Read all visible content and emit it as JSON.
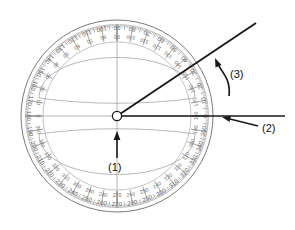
{
  "figure": {
    "kind": "protractor-diagram",
    "background_color": "#ffffff",
    "line_color": "#1a1a1a",
    "scale_color": "#6b6b6b",
    "faint_color": "#9a9a9a"
  },
  "protractor": {
    "name": "circular-protractor",
    "center_x": 117,
    "center_y": 116,
    "outer_radius": 96,
    "ring_inner_radius": 74,
    "tick_major_every_deg": 10,
    "tick_minor_every_deg": 1,
    "scale_outer_labels": [
      0,
      10,
      20,
      30,
      40,
      50,
      60,
      70,
      80,
      90,
      100,
      110,
      120,
      130,
      140,
      150,
      160,
      170,
      180,
      190,
      200,
      210,
      220,
      230,
      240,
      250,
      260,
      270,
      280,
      290,
      300,
      310,
      320,
      330,
      340,
      350
    ],
    "scale_inner_labels": [
      180,
      170,
      160,
      150,
      140,
      130,
      120,
      110,
      100,
      90,
      80,
      70,
      60,
      50,
      40,
      30,
      20,
      10,
      0,
      350,
      340,
      330,
      320,
      310,
      300,
      290,
      280,
      270,
      260,
      250,
      240,
      230,
      220,
      210,
      200,
      190
    ],
    "cardinal_top": "90",
    "cardinal_bottom": "270",
    "cardinal_left": "180",
    "cardinal_right": "0"
  },
  "arm": {
    "name": "rotating-ruler-arm",
    "from_x": 117,
    "from_y": 116,
    "to_x": 256,
    "to_y": 23,
    "angle_deg": 34
  },
  "base_line": {
    "name": "base-reference-line",
    "from_x": 117,
    "from_y": 116,
    "to_x": 285,
    "to_y": 116
  },
  "callouts": [
    {
      "id": "1",
      "label": "(1)",
      "name": "callout-1-pivot",
      "label_x": 108,
      "label_y": 161,
      "arrow_from_x": 117,
      "arrow_from_y": 158,
      "arrow_to_x": 117,
      "arrow_to_y": 131,
      "target": "center-pivot"
    },
    {
      "id": "2",
      "label": "(2)",
      "name": "callout-2-base-line",
      "label_x": 262,
      "label_y": 122,
      "arrow_from_x": 258,
      "arrow_from_y": 126,
      "arrow_to_x": 222,
      "arrow_to_y": 117,
      "target": "base-reference-line"
    },
    {
      "id": "3",
      "label": "(3)",
      "name": "callout-3-rotation",
      "label_x": 230,
      "label_y": 68,
      "arrow_from_x": 229,
      "arrow_from_y": 96,
      "arrow_to_x": 215,
      "arrow_to_y": 58,
      "target": "rotating-ruler-arm"
    }
  ]
}
